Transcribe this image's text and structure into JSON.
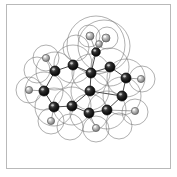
{
  "figure": {
    "kind": "molecular-structure-diagram",
    "representation": "ball-and-stick with van der Waals surface outlines",
    "caption": "",
    "background_color": "#ffffff",
    "frame_color": "#b9b9b9",
    "bond_color": "#3a3a3a",
    "vdw_outline_color": "#6e6e6e",
    "carbon_color": "#1a1a1a",
    "hydrogen_color": "#9a9a9a",
    "width": 177,
    "height": 177
  },
  "legend": {
    "carbon_label": "C",
    "hydrogen_label": "H"
  },
  "molecule": {
    "name": "",
    "atoms": [
      {
        "id": "C1",
        "element": "C",
        "x": 55,
        "y": 71,
        "r": 5.0
      },
      {
        "id": "C2",
        "element": "C",
        "x": 73,
        "y": 65,
        "r": 5.0
      },
      {
        "id": "C3",
        "element": "C",
        "x": 91,
        "y": 73,
        "r": 5.0
      },
      {
        "id": "C4",
        "element": "C",
        "x": 110,
        "y": 67,
        "r": 5.0
      },
      {
        "id": "C5",
        "element": "C",
        "x": 126,
        "y": 78,
        "r": 5.0
      },
      {
        "id": "C6",
        "element": "C",
        "x": 122,
        "y": 96,
        "r": 5.0
      },
      {
        "id": "C7",
        "element": "C",
        "x": 107,
        "y": 110,
        "r": 5.0
      },
      {
        "id": "C8",
        "element": "C",
        "x": 89,
        "y": 113,
        "r": 5.0
      },
      {
        "id": "C9",
        "element": "C",
        "x": 72,
        "y": 106,
        "r": 5.0
      },
      {
        "id": "C10",
        "element": "C",
        "x": 54,
        "y": 107,
        "r": 5.0
      },
      {
        "id": "C11",
        "element": "C",
        "x": 44,
        "y": 91,
        "r": 5.0
      },
      {
        "id": "C12",
        "element": "C",
        "x": 90,
        "y": 91,
        "r": 5.0
      },
      {
        "id": "C13",
        "element": "C",
        "x": 96,
        "y": 52,
        "r": 4.3
      },
      {
        "id": "H1",
        "element": "H",
        "x": 46,
        "y": 58,
        "r": 3.6
      },
      {
        "id": "H2",
        "element": "H",
        "x": 29,
        "y": 90,
        "r": 3.6
      },
      {
        "id": "H3",
        "element": "H",
        "x": 51,
        "y": 121,
        "r": 3.6
      },
      {
        "id": "H4",
        "element": "H",
        "x": 96,
        "y": 128,
        "r": 3.6
      },
      {
        "id": "H5",
        "element": "H",
        "x": 135,
        "y": 111,
        "r": 3.6
      },
      {
        "id": "H6",
        "element": "H",
        "x": 141,
        "y": 79,
        "r": 3.6
      },
      {
        "id": "H7",
        "element": "H",
        "x": 90,
        "y": 36,
        "r": 4.0
      },
      {
        "id": "H8",
        "element": "H",
        "x": 106,
        "y": 38,
        "r": 4.0
      },
      {
        "id": "H9",
        "element": "H",
        "x": 99,
        "y": 44,
        "r": 3.4
      }
    ],
    "bonds": [
      {
        "a": "C1",
        "b": "C2"
      },
      {
        "a": "C2",
        "b": "C3"
      },
      {
        "a": "C3",
        "b": "C4"
      },
      {
        "a": "C4",
        "b": "C5"
      },
      {
        "a": "C5",
        "b": "C6"
      },
      {
        "a": "C6",
        "b": "C7"
      },
      {
        "a": "C7",
        "b": "C8"
      },
      {
        "a": "C8",
        "b": "C9"
      },
      {
        "a": "C9",
        "b": "C10"
      },
      {
        "a": "C10",
        "b": "C11"
      },
      {
        "a": "C11",
        "b": "C1"
      },
      {
        "a": "C3",
        "b": "C12"
      },
      {
        "a": "C12",
        "b": "C6"
      },
      {
        "a": "C12",
        "b": "C9"
      },
      {
        "a": "C3",
        "b": "C13"
      },
      {
        "a": "C1",
        "b": "H1"
      },
      {
        "a": "C11",
        "b": "H2"
      },
      {
        "a": "C10",
        "b": "H3"
      },
      {
        "a": "C8",
        "b": "H4"
      },
      {
        "a": "C7",
        "b": "H5"
      },
      {
        "a": "C5",
        "b": "H6"
      },
      {
        "a": "C13",
        "b": "H7"
      },
      {
        "a": "C13",
        "b": "H8"
      },
      {
        "a": "C13",
        "b": "H9"
      }
    ],
    "vdw_spheres": [
      {
        "cx": 96,
        "cy": 45,
        "r": 29
      },
      {
        "cx": 104,
        "cy": 46,
        "r": 26
      },
      {
        "cx": 89,
        "cy": 36,
        "r": 11
      },
      {
        "cx": 107,
        "cy": 38,
        "r": 11
      },
      {
        "cx": 55,
        "cy": 71,
        "r": 19
      },
      {
        "cx": 73,
        "cy": 64,
        "r": 19
      },
      {
        "cx": 91,
        "cy": 73,
        "r": 19
      },
      {
        "cx": 110,
        "cy": 67,
        "r": 19
      },
      {
        "cx": 126,
        "cy": 78,
        "r": 19
      },
      {
        "cx": 122,
        "cy": 96,
        "r": 19
      },
      {
        "cx": 107,
        "cy": 110,
        "r": 19
      },
      {
        "cx": 89,
        "cy": 113,
        "r": 19
      },
      {
        "cx": 72,
        "cy": 106,
        "r": 19
      },
      {
        "cx": 54,
        "cy": 107,
        "r": 19
      },
      {
        "cx": 44,
        "cy": 91,
        "r": 19
      },
      {
        "cx": 90,
        "cy": 91,
        "r": 19
      },
      {
        "cx": 46,
        "cy": 58,
        "r": 13
      },
      {
        "cx": 29,
        "cy": 90,
        "r": 13
      },
      {
        "cx": 51,
        "cy": 121,
        "r": 13
      },
      {
        "cx": 96,
        "cy": 129,
        "r": 13
      },
      {
        "cx": 135,
        "cy": 112,
        "r": 13
      },
      {
        "cx": 142,
        "cy": 79,
        "r": 13
      },
      {
        "cx": 70,
        "cy": 127,
        "r": 13
      },
      {
        "cx": 119,
        "cy": 126,
        "r": 13
      },
      {
        "cx": 37,
        "cy": 70,
        "r": 13
      },
      {
        "cx": 76,
        "cy": 48,
        "r": 13
      }
    ]
  }
}
